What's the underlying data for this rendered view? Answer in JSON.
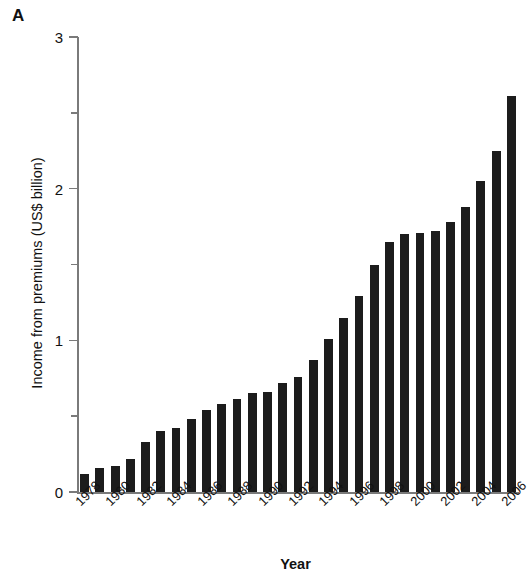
{
  "panel": {
    "letter": "A"
  },
  "chart_data": {
    "type": "bar",
    "title": "",
    "xlabel": "Year",
    "ylabel": "Income from premiums (US$ billion)",
    "ylim": [
      0,
      3
    ],
    "yticks": [
      0,
      1,
      2,
      3
    ],
    "yticklabels": [
      "0",
      "1",
      "2",
      "3"
    ],
    "yminorticks": [
      0.5,
      1.5,
      2.5
    ],
    "grid": false,
    "legend": null,
    "bar_color": "#1c1c1c",
    "categories": [
      "1978",
      "1979",
      "1980",
      "1981",
      "1982",
      "1983",
      "1984",
      "1985",
      "1986",
      "1987",
      "1988",
      "1989",
      "1990",
      "1991",
      "1992",
      "1993",
      "1994",
      "1995",
      "1996",
      "1997",
      "1998",
      "1999",
      "2000",
      "2001",
      "2002",
      "2003",
      "2004",
      "2005",
      "2006"
    ],
    "xticklabels_shown": [
      "1978",
      "1980",
      "1982",
      "1984",
      "1986",
      "1988",
      "1990",
      "1992",
      "1994",
      "1996",
      "1998",
      "2000",
      "2002",
      "2004",
      "2006"
    ],
    "values": [
      0.12,
      0.16,
      0.17,
      0.22,
      0.33,
      0.4,
      0.42,
      0.48,
      0.54,
      0.58,
      0.61,
      0.65,
      0.66,
      0.72,
      0.76,
      0.87,
      1.01,
      1.15,
      1.29,
      1.5,
      1.65,
      1.7,
      1.71,
      1.72,
      1.78,
      1.88,
      2.05,
      2.25,
      2.61
    ]
  }
}
